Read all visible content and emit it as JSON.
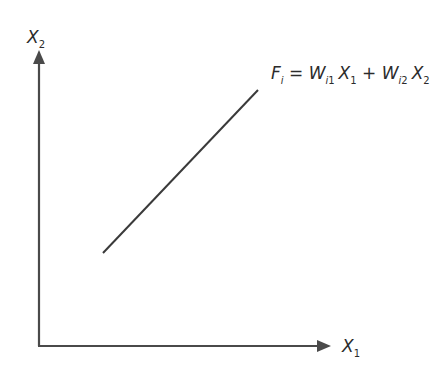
{
  "diagram": {
    "type": "linear-function-plot",
    "colors": {
      "axis": "#4a4a4a",
      "line": "#3a3a3a",
      "text": "#2b2b2b",
      "background": "#ffffff"
    },
    "y_axis": {
      "label_var": "X",
      "label_sub": "2"
    },
    "x_axis": {
      "label_var": "X",
      "label_sub": "1"
    },
    "equation": {
      "lhs_var": "F",
      "lhs_sub": "i",
      "equals": "=",
      "term1_coef": "W",
      "term1_coef_sub_i": "i",
      "term1_coef_sub_n": "1",
      "term1_var": "X",
      "term1_var_sub": "1",
      "plus": "+",
      "term2_coef": "W",
      "term2_coef_sub_i": "i",
      "term2_coef_sub_n": "2",
      "term2_var": "X",
      "term2_var_sub": "2",
      "full_text": "F_i = W_i1 X_1 + W_i2 X_2"
    },
    "line_segment": {
      "start": [
        103,
        253
      ],
      "end": [
        258,
        90
      ]
    }
  }
}
